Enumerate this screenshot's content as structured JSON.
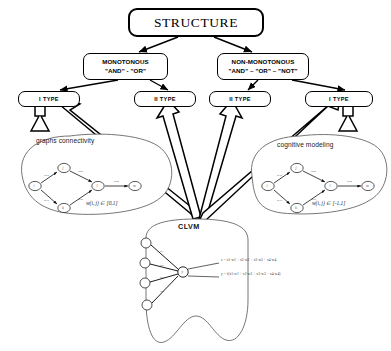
{
  "diagram": {
    "title": "STRUCTURE",
    "root": {
      "label": "STRUCTURE"
    },
    "logic_nodes": [
      {
        "id": "monotonous",
        "line1": "MONOTONOUS",
        "line2": "\"AND\" - \"OR\""
      },
      {
        "id": "non-monotonous",
        "line1": "NON-MONOTONOUS",
        "line2": "\"AND\" – \"OR\" – \"NOT\""
      }
    ],
    "type_nodes": [
      {
        "id": "type-1-left",
        "label": "I TYPE"
      },
      {
        "id": "type-2-left",
        "label": "II TYPE"
      },
      {
        "id": "type-2-right",
        "label": "II TYPE"
      },
      {
        "id": "type-1-right",
        "label": "I TYPE"
      }
    ],
    "clouds": [
      {
        "id": "graphs-connectivity",
        "label": "graphs connectivity",
        "formula": "w(i, j) ∈ [0,1]",
        "edge_weights": [
          "w12",
          "w23",
          "w13",
          "w34",
          "w45"
        ],
        "node_labels": [
          "i",
          "j",
          "k",
          "l",
          "m"
        ]
      },
      {
        "id": "cognitive-modeling",
        "label": "cognitive modeling",
        "formula": "w(i, j) ∈ [-1,1]",
        "edge_weights": [
          "w12",
          "w23",
          "w13",
          "w34",
          "w45"
        ],
        "node_labels": [
          "i",
          "j",
          "k",
          "l",
          "m"
        ]
      }
    ],
    "clvm": {
      "label": "CLVM",
      "input_weights": [
        "w1",
        "w2",
        "w3",
        "w4"
      ],
      "neuron_label": "y",
      "output_formulas": [
        "s = x1·w1 + x2·w2 + x3·w3 + x4·w4",
        "y = f(x1·w1 + x2·w2 + x3·w3 + x4·w4)"
      ]
    },
    "colors": {
      "ink": "#000000",
      "background": "#ffffff",
      "cloud_stroke": "#555555",
      "arrow_fill": "#ffffff"
    }
  }
}
